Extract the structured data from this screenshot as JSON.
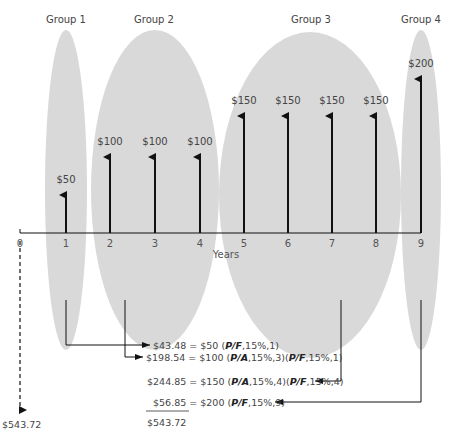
{
  "groups": [
    {
      "label": "Group 1",
      "cx": 66,
      "cy": 190,
      "rx": 21,
      "ry": 160,
      "label_x": 66
    },
    {
      "label": "Group 2",
      "cx": 155,
      "cy": 190,
      "rx": 64,
      "ry": 160,
      "label_x": 154
    },
    {
      "label": "Group 3",
      "cx": 310,
      "cy": 195,
      "rx": 91,
      "ry": 163,
      "label_x": 311
    },
    {
      "label": "Group 4",
      "cx": 421,
      "cy": 190,
      "rx": 20,
      "ry": 160,
      "label_x": 421
    }
  ],
  "axis": {
    "label": "Years",
    "ticks": [
      "0",
      "1",
      "2",
      "3",
      "4",
      "5",
      "6",
      "7",
      "8",
      "9"
    ],
    "tick_x": [
      20,
      66,
      110,
      155,
      200,
      244,
      288,
      332,
      376,
      421
    ],
    "y": 233
  },
  "cash_flows": [
    {
      "year": 1,
      "label": "$50",
      "top": 195
    },
    {
      "year": 2,
      "label": "$100",
      "top": 157
    },
    {
      "year": 3,
      "label": "$100",
      "top": 157
    },
    {
      "year": 4,
      "label": "$100",
      "top": 157
    },
    {
      "year": 5,
      "label": "$150",
      "top": 116
    },
    {
      "year": 6,
      "label": "$150",
      "top": 116
    },
    {
      "year": 7,
      "label": "$150",
      "top": 116
    },
    {
      "year": 8,
      "label": "$150",
      "top": 116
    },
    {
      "year": 9,
      "label": "$200",
      "top": 79
    }
  ],
  "present_worth": {
    "label": "$543.72",
    "arrow_bottom": 410
  },
  "equations": [
    {
      "result": "$43.48",
      "amount": "$50",
      "parts": [
        "(",
        "P/F",
        ",15%,1)"
      ]
    },
    {
      "result": "$198.54",
      "amount": "$100",
      "parts": [
        "(",
        "P/A",
        ",15%,3)(",
        "P/F",
        ",15%,1)"
      ]
    },
    {
      "result": "$244.85",
      "amount": "$150",
      "parts": [
        "(",
        "P/A",
        ",15%,4)(",
        "P/F",
        ",15%,4)"
      ]
    },
    {
      "result": "$56.85",
      "amount": "$200",
      "parts": [
        "(",
        "P/F",
        ",15%,9)"
      ]
    }
  ],
  "total": "$543.72",
  "colors": {
    "ellipse": "#d9d9d9",
    "line": "#111111",
    "text": "#444444"
  }
}
